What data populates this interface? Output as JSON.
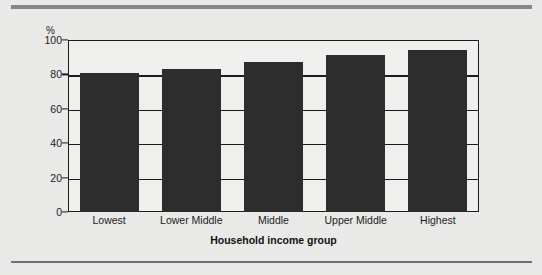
{
  "figure": {
    "background_color": "#e9e9e7",
    "rule_top_color": "#85858a",
    "rule_bottom_color": "#6f6f74"
  },
  "chart_data": {
    "type": "bar",
    "title": "",
    "subtitle": "",
    "xlabel": "Household income group",
    "ylabel": "",
    "y_unit_label": "%",
    "categories": [
      "Lowest",
      "Lower Middle",
      "Middle",
      "Upper Middle",
      "Highest"
    ],
    "values": [
      81,
      83,
      87,
      91,
      94
    ],
    "ylim": [
      0,
      100
    ],
    "yticks": [
      0,
      20,
      40,
      60,
      80,
      100
    ],
    "ytick_labels": [
      "0",
      "20",
      "40",
      "60",
      "80",
      "100"
    ],
    "grid": true,
    "grid_axis": "y",
    "legend": false,
    "legend_position": "none",
    "bar_color": "#2d2d2d",
    "axis_color": "#1c1c1c",
    "plot_background": "#efefed"
  }
}
